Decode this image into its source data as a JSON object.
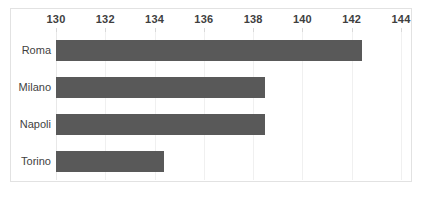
{
  "chart_data": {
    "type": "bar",
    "orientation": "horizontal",
    "title": "",
    "xlabel": "",
    "ylabel": "",
    "categories": [
      "Roma",
      "Milano",
      "Napoli",
      "Torino"
    ],
    "values": [
      142.4,
      138.5,
      138.5,
      134.4
    ],
    "series": [
      {
        "name": "",
        "values": [
          142.4,
          138.5,
          138.5,
          134.4
        ]
      }
    ],
    "xlim": [
      130,
      144
    ],
    "xticks": [
      130,
      132,
      134,
      136,
      138,
      140,
      142,
      144
    ],
    "xtick_labels": [
      "130",
      "132",
      "134",
      "136",
      "138",
      "140",
      "142",
      "144"
    ],
    "xaxis_position": "top",
    "grid": true,
    "grid_axis": "x",
    "legend": false,
    "bar_color": "#595959",
    "grid_color": "#f0f0f0",
    "border_color": "#e2e2e2",
    "label_color": "#3f3f3f"
  }
}
